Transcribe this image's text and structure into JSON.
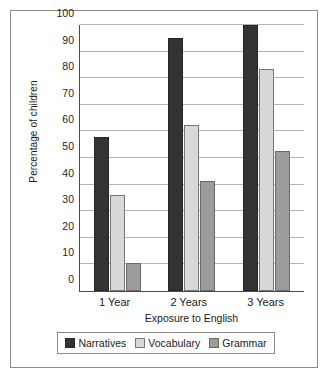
{
  "chart_data": {
    "type": "bar",
    "title": "",
    "subtitle": "",
    "xlabel": "Exposure to English",
    "ylabel": "Percentage of children",
    "categories": [
      "1 Year",
      "2 Years",
      "3 Years"
    ],
    "series": [
      {
        "name": "Narratives",
        "color": "#333333",
        "values": [
          58,
          95,
          100
        ]
      },
      {
        "name": "Vocabulary",
        "color": "#d8d8d8",
        "values": [
          36,
          62.5,
          83.5
        ]
      },
      {
        "name": "Grammar",
        "color": "#9c9c9c",
        "values": [
          10.5,
          41.5,
          52.5
        ]
      }
    ],
    "ylim": [
      0,
      100
    ],
    "ytick_labels": [
      "0",
      "10",
      "20",
      "30",
      "40",
      "50",
      "60",
      "70",
      "80",
      "90",
      "100"
    ],
    "ytick_values": [
      0,
      10,
      20,
      30,
      40,
      50,
      60,
      70,
      80,
      90,
      100
    ],
    "grid": true,
    "legend_position": "bottom"
  }
}
